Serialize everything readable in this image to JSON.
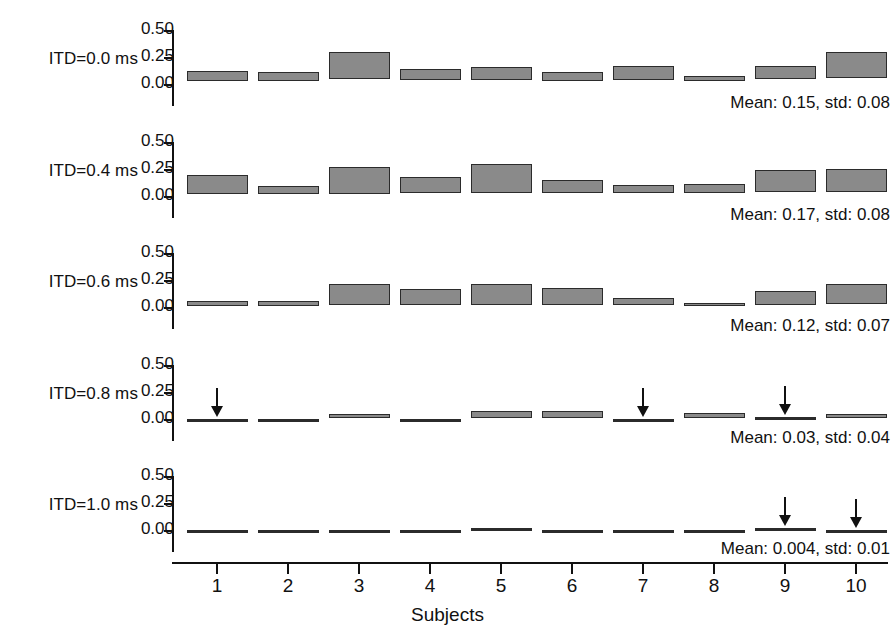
{
  "chart_data": {
    "type": "bar",
    "title": "",
    "xlabel": "Subjects",
    "ylabel": "",
    "categories": [
      "1",
      "2",
      "3",
      "4",
      "5",
      "6",
      "7",
      "8",
      "9",
      "10"
    ],
    "ylim": [
      0.0,
      0.5
    ],
    "ytick_values": [
      "0.50",
      "0.25",
      "0.00"
    ],
    "grid": false,
    "legend": "none",
    "note": "Each panel shows a horizontal box per subject spanning a value range; boxes drawn as floating bars (low-high). Arrows mark subjects whose response was at/near zero.",
    "panels": [
      {
        "label": "ITD=0.0 ms",
        "stats": "Mean: 0.15, std: 0.08",
        "mean": 0.15,
        "std": 0.08,
        "bars": [
          {
            "subject": "1",
            "low": 0.03,
            "high": 0.12,
            "arrow": false
          },
          {
            "subject": "2",
            "low": 0.03,
            "high": 0.11,
            "arrow": false
          },
          {
            "subject": "3",
            "low": 0.05,
            "high": 0.3,
            "arrow": false
          },
          {
            "subject": "4",
            "low": 0.04,
            "high": 0.14,
            "arrow": false
          },
          {
            "subject": "5",
            "low": 0.04,
            "high": 0.16,
            "arrow": false
          },
          {
            "subject": "6",
            "low": 0.03,
            "high": 0.11,
            "arrow": false
          },
          {
            "subject": "7",
            "low": 0.04,
            "high": 0.17,
            "arrow": false
          },
          {
            "subject": "8",
            "low": 0.03,
            "high": 0.07,
            "arrow": false
          },
          {
            "subject": "9",
            "low": 0.05,
            "high": 0.17,
            "arrow": false
          },
          {
            "subject": "10",
            "low": 0.06,
            "high": 0.3,
            "arrow": false
          }
        ]
      },
      {
        "label": "ITD=0.4 ms",
        "stats": "Mean: 0.17, std: 0.08",
        "mean": 0.17,
        "std": 0.08,
        "bars": [
          {
            "subject": "1",
            "low": 0.02,
            "high": 0.19,
            "arrow": false
          },
          {
            "subject": "2",
            "low": 0.02,
            "high": 0.09,
            "arrow": false
          },
          {
            "subject": "3",
            "low": 0.02,
            "high": 0.27,
            "arrow": false
          },
          {
            "subject": "4",
            "low": 0.03,
            "high": 0.18,
            "arrow": false
          },
          {
            "subject": "5",
            "low": 0.03,
            "high": 0.3,
            "arrow": false
          },
          {
            "subject": "6",
            "low": 0.03,
            "high": 0.15,
            "arrow": false
          },
          {
            "subject": "7",
            "low": 0.03,
            "high": 0.1,
            "arrow": false
          },
          {
            "subject": "8",
            "low": 0.03,
            "high": 0.11,
            "arrow": false
          },
          {
            "subject": "9",
            "low": 0.04,
            "high": 0.24,
            "arrow": false
          },
          {
            "subject": "10",
            "low": 0.04,
            "high": 0.25,
            "arrow": false
          }
        ]
      },
      {
        "label": "ITD=0.6 ms",
        "stats": "Mean: 0.12, std: 0.07",
        "mean": 0.12,
        "std": 0.07,
        "bars": [
          {
            "subject": "1",
            "low": 0.01,
            "high": 0.06,
            "arrow": false
          },
          {
            "subject": "2",
            "low": 0.01,
            "high": 0.06,
            "arrow": false
          },
          {
            "subject": "3",
            "low": 0.02,
            "high": 0.21,
            "arrow": false
          },
          {
            "subject": "4",
            "low": 0.02,
            "high": 0.17,
            "arrow": false
          },
          {
            "subject": "5",
            "low": 0.02,
            "high": 0.21,
            "arrow": false
          },
          {
            "subject": "6",
            "low": 0.02,
            "high": 0.18,
            "arrow": false
          },
          {
            "subject": "7",
            "low": 0.02,
            "high": 0.08,
            "arrow": false
          },
          {
            "subject": "8",
            "low": 0.01,
            "high": 0.04,
            "arrow": false
          },
          {
            "subject": "9",
            "low": 0.02,
            "high": 0.15,
            "arrow": false
          },
          {
            "subject": "10",
            "low": 0.03,
            "high": 0.21,
            "arrow": false
          }
        ]
      },
      {
        "label": "ITD=0.8 ms",
        "stats": "Mean: 0.03, std: 0.04",
        "mean": 0.03,
        "std": 0.04,
        "bars": [
          {
            "subject": "1",
            "low": 0.0,
            "high": 0.0,
            "arrow": true
          },
          {
            "subject": "2",
            "low": 0.0,
            "high": 0.0,
            "arrow": false
          },
          {
            "subject": "3",
            "low": 0.01,
            "high": 0.05,
            "arrow": false
          },
          {
            "subject": "4",
            "low": 0.0,
            "high": 0.0,
            "arrow": false
          },
          {
            "subject": "5",
            "low": 0.01,
            "high": 0.07,
            "arrow": false
          },
          {
            "subject": "6",
            "low": 0.01,
            "high": 0.07,
            "arrow": false
          },
          {
            "subject": "7",
            "low": 0.0,
            "high": 0.0,
            "arrow": true
          },
          {
            "subject": "8",
            "low": 0.01,
            "high": 0.06,
            "arrow": false
          },
          {
            "subject": "9",
            "low": 0.0,
            "high": 0.01,
            "arrow": true
          },
          {
            "subject": "10",
            "low": 0.01,
            "high": 0.05,
            "arrow": false
          }
        ]
      },
      {
        "label": "ITD=1.0 ms",
        "stats": "Mean: 0.004, std: 0.01",
        "mean": 0.004,
        "std": 0.01,
        "bars": [
          {
            "subject": "1",
            "low": 0.0,
            "high": 0.0,
            "arrow": false
          },
          {
            "subject": "2",
            "low": 0.0,
            "high": 0.0,
            "arrow": false
          },
          {
            "subject": "3",
            "low": 0.0,
            "high": 0.0,
            "arrow": false
          },
          {
            "subject": "4",
            "low": 0.0,
            "high": 0.0,
            "arrow": false
          },
          {
            "subject": "5",
            "low": 0.0,
            "high": 0.015,
            "arrow": false
          },
          {
            "subject": "6",
            "low": 0.0,
            "high": 0.0,
            "arrow": false
          },
          {
            "subject": "7",
            "low": 0.0,
            "high": 0.0,
            "arrow": false
          },
          {
            "subject": "8",
            "low": 0.0,
            "high": 0.0,
            "arrow": false
          },
          {
            "subject": "9",
            "low": 0.0,
            "high": 0.015,
            "arrow": true
          },
          {
            "subject": "10",
            "low": 0.0,
            "high": 0.0,
            "arrow": true
          }
        ]
      }
    ]
  },
  "style": {
    "bar_fill": "#8a8a8a",
    "bar_stroke": "#2b2b2b",
    "axis_color": "#111111",
    "background": "#ffffff"
  }
}
